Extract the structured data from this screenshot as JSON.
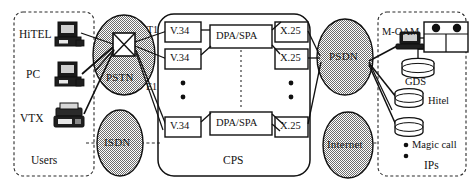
{
  "figure": {
    "caption": ""
  },
  "groups": {
    "users": {
      "label": "Users"
    },
    "cps": {
      "label": "CPS"
    },
    "ips": {
      "label": "IPs"
    }
  },
  "users": {
    "items": [
      {
        "label": "HiTEL",
        "icon": "terminal-icon"
      },
      {
        "label": "PC",
        "icon": "computer-icon"
      },
      {
        "label": "VTX",
        "icon": "videotex-terminal-icon"
      }
    ]
  },
  "networks": [
    {
      "id": "pstn",
      "label": "PSTN",
      "shape": "ellipse"
    },
    {
      "id": "isdn",
      "label": "ISDN",
      "shape": "ellipse"
    },
    {
      "id": "psdn",
      "label": "PSDN",
      "shape": "ellipse"
    },
    {
      "id": "internet",
      "label": "Internet",
      "shape": "ellipse"
    }
  ],
  "links": {
    "t1": "T1",
    "e1": "E1"
  },
  "cps": {
    "access_modules": [
      {
        "label": "V.34"
      },
      {
        "label": "V.34"
      },
      {
        "label": "V.34"
      }
    ],
    "processor_modules": [
      {
        "label": "DPA/SPA"
      },
      {
        "label": "DPA/SPA"
      }
    ],
    "packet_modules": [
      {
        "label": "X.25"
      },
      {
        "label": "X.25"
      },
      {
        "label": "X.25"
      }
    ],
    "ellipsis": "vertical-dots"
  },
  "providers": {
    "management": {
      "label": "M-OAM",
      "icon": "workstation-icon"
    },
    "servers": [
      {
        "label": "GDS",
        "icon": "database-icon"
      },
      {
        "label": "Hitel",
        "icon": "database-icon"
      },
      {
        "label": "Magic call",
        "icon": "database-icon"
      }
    ],
    "rack": {
      "icon": "server-rack-icon"
    }
  },
  "colors": {
    "ellipse_fill": "#c9c9c9",
    "stroke": "#101010",
    "text": "#121212",
    "box_fill": "#ffffff"
  }
}
